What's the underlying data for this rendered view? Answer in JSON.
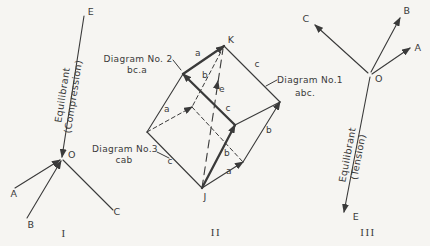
{
  "page": {
    "paper_color": "#f6f5f2",
    "ink_color": "#3a3a3a"
  },
  "diagrams": [
    {
      "id": "space-diagram-compression",
      "numeral": {
        "text": "I",
        "x": 64,
        "y": 237
      },
      "lines": [
        {
          "name": "equilibrant-compression-line",
          "x1": 84,
          "y1": 16,
          "x2": 62,
          "y2": 157,
          "arrow": true
        },
        {
          "name": "force-a-line",
          "x1": 15,
          "y1": 188,
          "x2": 60,
          "y2": 160,
          "arrow": true
        },
        {
          "name": "force-b-line",
          "x1": 27,
          "y1": 218,
          "x2": 61,
          "y2": 161,
          "arrow": true
        },
        {
          "name": "force-c-line",
          "x1": 63,
          "y1": 160,
          "x2": 113,
          "y2": 210,
          "arrow": false
        }
      ],
      "labels": [
        {
          "name": "point-label-e",
          "text": "E",
          "x": 91,
          "y": 15,
          "cls": "vertex"
        },
        {
          "name": "point-label-o",
          "text": "O",
          "x": 68,
          "y": 158,
          "anchor": "start",
          "cls": "vertex"
        },
        {
          "name": "point-label-a",
          "text": "A",
          "x": 14,
          "y": 197,
          "cls": "vertex"
        },
        {
          "name": "point-label-b",
          "text": "B",
          "x": 31,
          "y": 228,
          "cls": "vertex"
        },
        {
          "name": "point-label-c",
          "text": "C",
          "x": 117,
          "y": 215,
          "cls": "vertex"
        }
      ],
      "rotated": {
        "name": "equilibrant-compression-caption",
        "lines": [
          "Equilibrant",
          "(Compression)"
        ],
        "x": 69,
        "y": 96,
        "angle": -81
      }
    },
    {
      "id": "force-parallelepiped",
      "numeral": {
        "text": "II",
        "x": 216,
        "y": 236
      },
      "lines": [
        {
          "name": "edge-c-k-r",
          "x1": 224,
          "y1": 46,
          "x2": 280,
          "y2": 102
        },
        {
          "name": "edge-b-ul-l",
          "x1": 183,
          "y1": 74,
          "x2": 147,
          "y2": 132
        },
        {
          "name": "edge-a-fc-r",
          "x1": 235,
          "y1": 125,
          "x2": 280,
          "y2": 102
        },
        {
          "name": "edge-c-j-l",
          "x1": 202,
          "y1": 188,
          "x2": 147,
          "y2": 132
        },
        {
          "name": "edge-b-lr-r",
          "x1": 243,
          "y1": 162,
          "x2": 280,
          "y2": 102,
          "arrow": true
        },
        {
          "name": "edge-a-j-lr",
          "x1": 202,
          "y1": 188,
          "x2": 243,
          "y2": 162,
          "arrow": true
        },
        {
          "name": "edge-b-k-in-hidden",
          "x1": 224,
          "y1": 46,
          "x2": 192,
          "y2": 107,
          "dash": "dashed"
        },
        {
          "name": "edge-a-l-in-hidden",
          "x1": 147,
          "y1": 132,
          "x2": 192,
          "y2": 107,
          "dash": "dashed",
          "arrow": true
        },
        {
          "name": "edge-c-in-lr-hidden",
          "x1": 192,
          "y1": 107,
          "x2": 243,
          "y2": 162,
          "dash": "dashed"
        },
        {
          "name": "resultant-e-diagonal",
          "x1": 202,
          "y1": 188,
          "x2": 223,
          "y2": 49,
          "dash": "longdash"
        },
        {
          "name": "resultant-e-arrow",
          "x1": 216.5,
          "y1": 88,
          "x2": 218,
          "y2": 81,
          "thin": true,
          "arrow": true
        },
        {
          "name": "edge-a-ul-k",
          "x1": 183,
          "y1": 74,
          "x2": 224,
          "y2": 46,
          "thick": true,
          "arrow": true
        },
        {
          "name": "edge-c-fc-ul",
          "x1": 235,
          "y1": 125,
          "x2": 183,
          "y2": 74,
          "thick": true,
          "arrow": true
        },
        {
          "name": "edge-b-j-fc",
          "x1": 202,
          "y1": 188,
          "x2": 235,
          "y2": 125,
          "thick": true,
          "arrow": true
        },
        {
          "name": "pointer-diagram-no2",
          "x1": 173,
          "y1": 60,
          "x2": 181,
          "y2": 70,
          "thin": true
        },
        {
          "name": "pointer-diagram-no3",
          "x1": 157,
          "y1": 152,
          "x2": 169,
          "y2": 158,
          "thin": true
        },
        {
          "name": "pointer-diagram-no1",
          "x1": 277,
          "y1": 80,
          "x2": 266,
          "y2": 86,
          "thin": true
        }
      ],
      "labels": [
        {
          "name": "vertex-label-k",
          "text": "K",
          "x": 231,
          "y": 43,
          "cls": "vertex"
        },
        {
          "name": "vertex-label-j",
          "text": "J",
          "x": 205,
          "y": 200,
          "cls": "vertex"
        },
        {
          "name": "edge-label-a-top",
          "text": "a",
          "x": 198,
          "y": 56
        },
        {
          "name": "edge-label-c-top",
          "text": "c",
          "x": 257,
          "y": 67
        },
        {
          "name": "edge-label-b-upper",
          "text": "b",
          "x": 205,
          "y": 78
        },
        {
          "name": "edge-label-e",
          "text": "e",
          "x": 222,
          "y": 92
        },
        {
          "name": "edge-label-a-mid",
          "text": "a",
          "x": 167,
          "y": 112
        },
        {
          "name": "edge-label-c-mid",
          "text": "c",
          "x": 228,
          "y": 111
        },
        {
          "name": "edge-label-c-lower",
          "text": "c",
          "x": 170,
          "y": 164
        },
        {
          "name": "edge-label-b-lower",
          "text": "b",
          "x": 227,
          "y": 156
        },
        {
          "name": "edge-label-b-right",
          "text": "b",
          "x": 269,
          "y": 133
        },
        {
          "name": "edge-label-a-bottom",
          "text": "a",
          "x": 229,
          "y": 174
        },
        {
          "name": "caption-diagram-no2",
          "text": "Diagram No. 2",
          "x": 138,
          "y": 62,
          "cls": "caption"
        },
        {
          "name": "caption-diagram-no2-order",
          "text": "bc.a",
          "x": 137,
          "y": 73,
          "cls": "caption"
        },
        {
          "name": "caption-diagram-no3",
          "text": "Diagram No.3",
          "x": 125,
          "y": 152,
          "cls": "caption"
        },
        {
          "name": "caption-diagram-no3-order",
          "text": "cab",
          "x": 124,
          "y": 163,
          "cls": "caption"
        },
        {
          "name": "caption-diagram-no1",
          "text": "Diagram No.1",
          "x": 310,
          "y": 83,
          "cls": "caption"
        },
        {
          "name": "caption-diagram-no1-order",
          "text": "abc.",
          "x": 305,
          "y": 96,
          "cls": "caption"
        }
      ]
    },
    {
      "id": "space-diagram-tension",
      "numeral": {
        "text": "III",
        "x": 368,
        "y": 236
      },
      "lines": [
        {
          "name": "equilibrant-tension-line",
          "x1": 370,
          "y1": 77,
          "x2": 344,
          "y2": 212,
          "arrow": true
        },
        {
          "name": "force-c-line",
          "x1": 368,
          "y1": 73,
          "x2": 315,
          "y2": 25,
          "arrow": true
        },
        {
          "name": "force-b-line",
          "x1": 371,
          "y1": 72,
          "x2": 400,
          "y2": 18,
          "arrow": true
        },
        {
          "name": "force-a-line",
          "x1": 372,
          "y1": 74,
          "x2": 410,
          "y2": 48,
          "arrow": true
        }
      ],
      "labels": [
        {
          "name": "point-label-c",
          "text": "C",
          "x": 306,
          "y": 22,
          "cls": "vertex"
        },
        {
          "name": "point-label-b",
          "text": "B",
          "x": 407,
          "y": 14,
          "cls": "vertex"
        },
        {
          "name": "point-label-a",
          "text": "A",
          "x": 418,
          "y": 51,
          "cls": "vertex"
        },
        {
          "name": "point-label-o",
          "text": "O",
          "x": 375,
          "y": 82,
          "anchor": "start",
          "cls": "vertex"
        },
        {
          "name": "point-label-e",
          "text": "E",
          "x": 356,
          "y": 220,
          "cls": "vertex"
        }
      ],
      "rotated": {
        "name": "equilibrant-tension-caption",
        "lines": [
          "Equilibrant",
          "(Tension)"
        ],
        "x": 354,
        "y": 156,
        "angle": -79
      }
    }
  ]
}
